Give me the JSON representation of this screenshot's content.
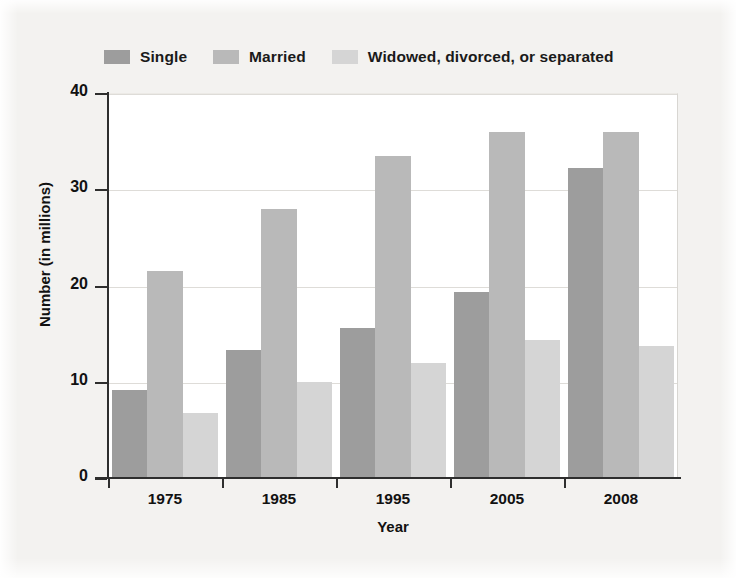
{
  "chart_data": {
    "type": "bar",
    "title": "",
    "xlabel": "Year",
    "ylabel": "Number (in millions)",
    "categories": [
      "1975",
      "1985",
      "1995",
      "2005",
      "2008"
    ],
    "series": [
      {
        "name": "Single",
        "color": "#9d9d9d",
        "values": [
          9.1,
          13.3,
          15.6,
          19.3,
          32.2
        ]
      },
      {
        "name": "Married",
        "color": "#b9b9b9",
        "values": [
          21.5,
          27.9,
          33.5,
          36.0,
          36.0
        ]
      },
      {
        "name": "Widowed, divorced, or separated",
        "color": "#d5d5d5",
        "values": [
          6.8,
          10.0,
          12.0,
          14.3,
          13.7
        ]
      }
    ],
    "ylim": [
      0,
      40
    ],
    "yticks": [
      "0",
      "10",
      "20",
      "30",
      "40"
    ],
    "ytick_values": [
      0,
      10,
      20,
      30,
      40
    ],
    "grid": true,
    "legend_position": "top-left",
    "axis_color": "#2e2e2e",
    "grid_color": "#dedcd8",
    "plot_background": "#ffffff",
    "figure_background": "#f3f2f0"
  },
  "legend": {
    "entries": [
      {
        "label": "Single"
      },
      {
        "label": "Married"
      },
      {
        "label": "Widowed, divorced, or separated"
      }
    ]
  }
}
